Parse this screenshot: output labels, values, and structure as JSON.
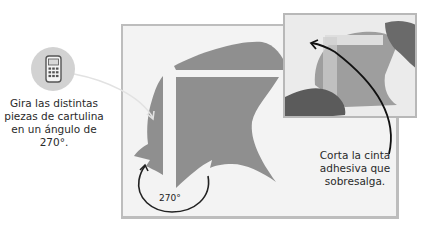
{
  "left_caption": {
    "lines": [
      "Gira las distintas",
      "piezas de cartulina",
      "en un ángulo de",
      "270°."
    ]
  },
  "right_caption": {
    "lines": [
      "Corta la cinta",
      "adhesiva que",
      "sobresalga."
    ]
  },
  "angle_label": "270°",
  "icons": {
    "calculator": "calculator-icon"
  },
  "colors": {
    "shape": "#8f8f8f",
    "board": "#f3f3f3",
    "icon_circle": "#d2d2d2"
  }
}
